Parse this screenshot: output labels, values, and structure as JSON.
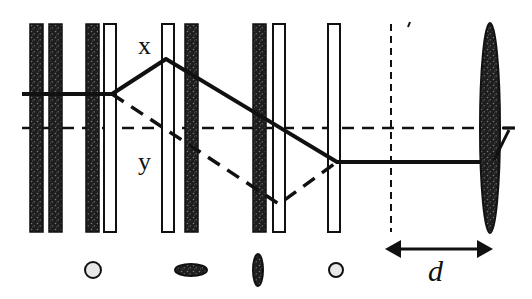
{
  "diagram": {
    "type": "optical polarization setup schematic",
    "colors": {
      "ink": "#111111",
      "background": "#ffffff",
      "plate_fill_dark": "#2a2a2a",
      "plate_fill_light": "#ffffff"
    },
    "labels": {
      "x": "x",
      "y": "y",
      "d": "d"
    },
    "plates": [
      {
        "kind": "dark",
        "x": 30
      },
      {
        "kind": "dark",
        "x": 49
      },
      {
        "kind": "dark",
        "x": 86
      },
      {
        "kind": "light",
        "x": 104
      },
      {
        "kind": "light",
        "x": 162
      },
      {
        "kind": "dark",
        "x": 185
      },
      {
        "kind": "dark",
        "x": 253
      },
      {
        "kind": "light",
        "x": 273
      },
      {
        "kind": "light",
        "x": 328
      }
    ],
    "polarization_icons": [
      {
        "shape": "circle",
        "cx": 93,
        "cy": 270
      },
      {
        "shape": "horizontal-ellipse",
        "cx": 191,
        "cy": 270
      },
      {
        "shape": "vertical-ellipse",
        "cx": 258,
        "cy": 270
      },
      {
        "shape": "circle",
        "cx": 336,
        "cy": 270
      }
    ],
    "lens": {
      "cx": 490,
      "cy": 128,
      "rx": 10,
      "ry": 105
    },
    "distance_arrow": {
      "x1": 385,
      "x2": 493,
      "y": 249,
      "label": "d"
    }
  }
}
